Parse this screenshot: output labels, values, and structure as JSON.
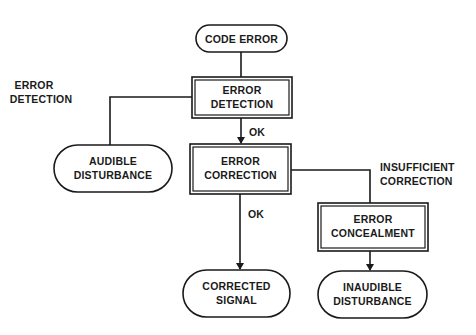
{
  "diagram": {
    "nodes": {
      "code_error": {
        "type": "terminal",
        "lines": [
          "CODE ERROR"
        ]
      },
      "error_detection": {
        "type": "process",
        "lines": [
          "ERROR",
          "DETECTION"
        ]
      },
      "error_correction": {
        "type": "process",
        "lines": [
          "ERROR",
          "CORRECTION"
        ]
      },
      "error_concealment": {
        "type": "process",
        "lines": [
          "ERROR",
          "CONCEALMENT"
        ]
      },
      "audible_disturbance": {
        "type": "terminal",
        "lines": [
          "AUDIBLE",
          "DISTURBANCE"
        ]
      },
      "corrected_signal": {
        "type": "terminal",
        "lines": [
          "CORRECTED",
          "SIGNAL"
        ]
      },
      "inaudible_disturbance": {
        "type": "terminal",
        "lines": [
          "INAUDIBLE",
          "DISTURBANCE"
        ]
      }
    },
    "edges": [
      {
        "from": "code_error",
        "to": "error_detection",
        "label": ""
      },
      {
        "from": "error_detection",
        "to": "error_correction",
        "label": "OK"
      },
      {
        "from": "error_detection",
        "to": "audible_disturbance",
        "label": ""
      },
      {
        "from": "error_correction",
        "to": "corrected_signal",
        "label": "OK"
      },
      {
        "from": "error_correction",
        "to": "error_concealment",
        "label": ""
      },
      {
        "from": "error_concealment",
        "to": "inaudible_disturbance",
        "label": ""
      }
    ],
    "annotations": {
      "error_detection_side": [
        "ERROR",
        "DETECTION"
      ],
      "insufficient_correction": [
        "INSUFFICIENT",
        "CORRECTION"
      ],
      "ok_detection": "OK",
      "ok_correction": "OK"
    },
    "colors": {
      "ink": "#1a1a1a",
      "background": "#ffffff"
    }
  }
}
